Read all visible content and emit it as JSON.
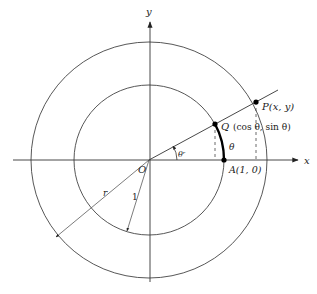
{
  "diagram": {
    "type": "unit-circle-trigonometry",
    "origin": {
      "label": "O",
      "px": [
        149,
        160
      ]
    },
    "axes": {
      "x": {
        "label": "x",
        "from": [
          13,
          160
        ],
        "to": [
          300,
          160
        ]
      },
      "y": {
        "label": "y",
        "from": [
          150,
          282
        ],
        "to": [
          150,
          20
        ]
      }
    },
    "circles": [
      {
        "name": "unit-circle",
        "r_px": 75,
        "radius_label": "1"
      },
      {
        "name": "outer-circle",
        "r_px": 118,
        "radius_label": "r"
      }
    ],
    "points": {
      "P": {
        "label": "P(x, y)",
        "px": [
          256,
          102
        ]
      },
      "Q": {
        "label": "Q (cos θ,  sin θ)",
        "px": [
          215,
          124
        ]
      },
      "A": {
        "label": "A(1, 0)",
        "px": [
          224,
          160
        ]
      }
    },
    "angle": {
      "label": "θʳ",
      "arc_label": "θ"
    },
    "labels": {
      "origin": "O",
      "x_axis": "x",
      "y_axis": "y",
      "P": "P(x, y)",
      "Q_name": "Q",
      "Q_coords": "(cos θ,  sin θ)",
      "A": "A(1, 0)",
      "arc_theta": "θ",
      "angle_theta": "θʳ",
      "radius_r": "r",
      "radius_1": "1"
    },
    "colors": {
      "line": "#333333",
      "bold_arc": "#000000",
      "text": "#222222"
    }
  }
}
